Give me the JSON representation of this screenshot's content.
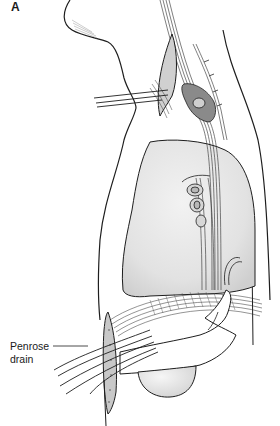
{
  "figure": {
    "panel_label": "A",
    "callouts": [
      {
        "line1": "Penrose",
        "line2": "drain",
        "target": "penrose-drain"
      }
    ],
    "colors": {
      "line": "#1e1e1e",
      "organ_fill": "#e4e4e4",
      "organ_shade": "#cfcfcf",
      "background": "#ffffff"
    }
  }
}
